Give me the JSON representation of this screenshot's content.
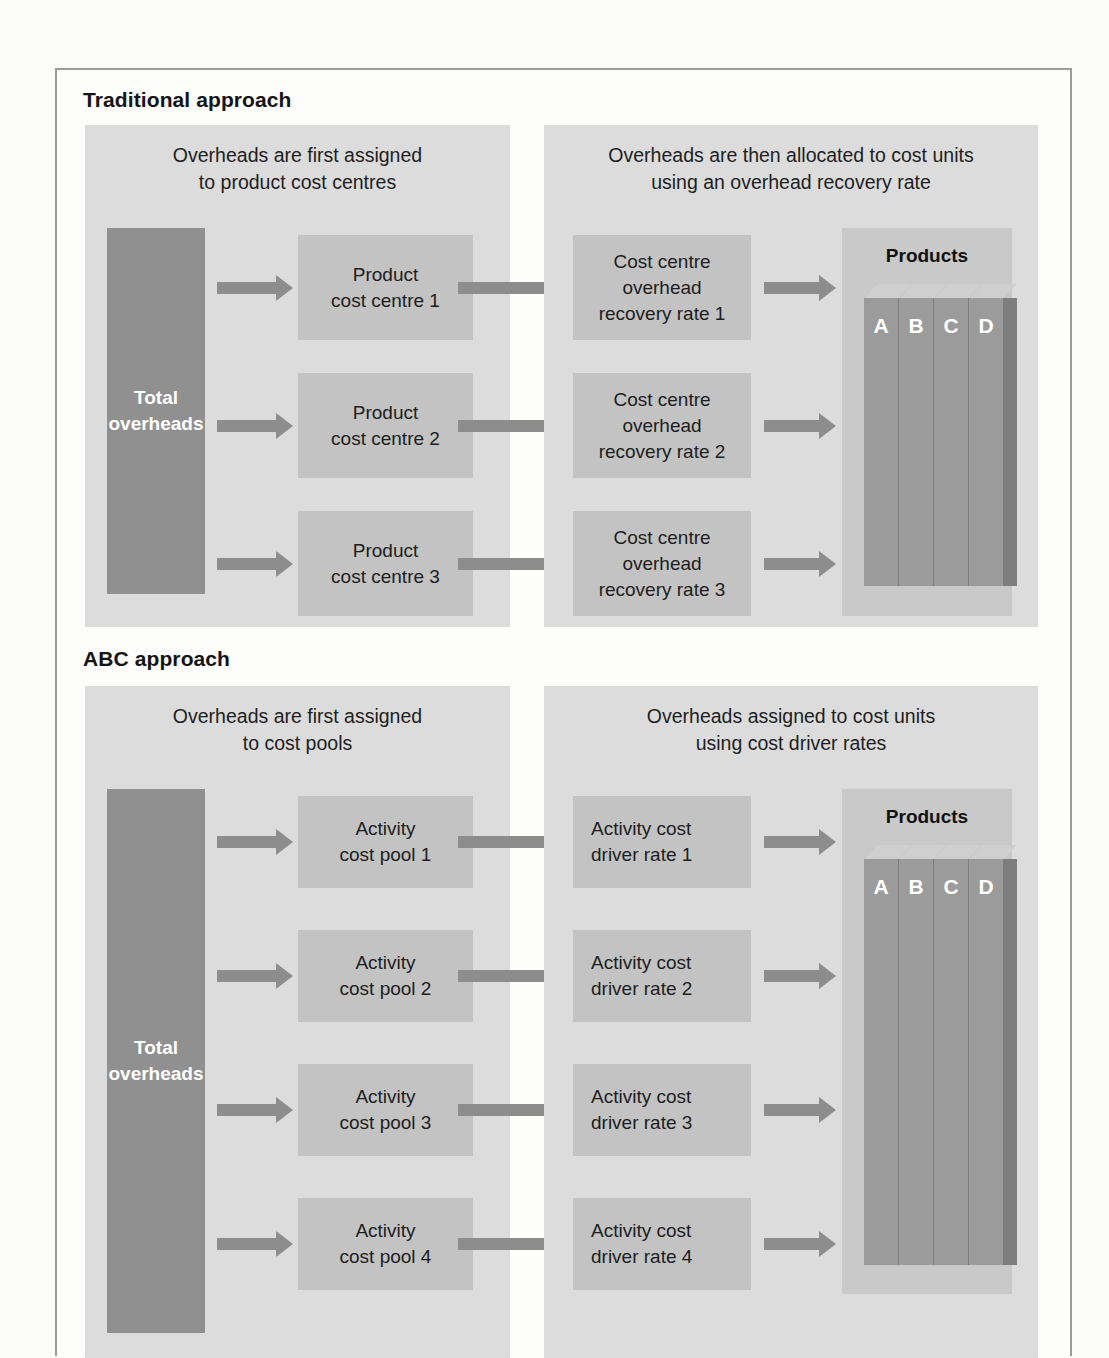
{
  "figure": {
    "sections": [
      {
        "id": "traditional",
        "title": "Traditional approach",
        "left_panel": {
          "caption_line1": "Overheads are first assigned",
          "caption_line2": "to product cost centres",
          "source_box": "Total overheads",
          "boxes": [
            "Product\ncost centre 1",
            "Product\ncost centre 2",
            "Product\ncost centre 3"
          ],
          "box_lines": [
            [
              "Product",
              "cost centre 1"
            ],
            [
              "Product",
              "cost centre 2"
            ],
            [
              "Product",
              "cost centre 3"
            ]
          ]
        },
        "right_panel": {
          "caption_line1": "Overheads are then allocated to cost units",
          "caption_line2": "using an overhead recovery rate",
          "box_lines": [
            [
              "Cost centre",
              "overhead",
              "recovery rate 1"
            ],
            [
              "Cost centre",
              "overhead",
              "recovery rate 2"
            ],
            [
              "Cost centre",
              "overhead",
              "recovery rate 3"
            ]
          ],
          "products": {
            "title": "Products",
            "labels": [
              "A",
              "B",
              "C",
              "D"
            ]
          }
        }
      },
      {
        "id": "abc",
        "title": "ABC approach",
        "left_panel": {
          "caption_line1": "Overheads are first assigned",
          "caption_line2": "to cost pools",
          "source_box": "Total overheads",
          "box_lines": [
            [
              "Activity",
              "cost pool 1"
            ],
            [
              "Activity",
              "cost pool 2"
            ],
            [
              "Activity",
              "cost pool 3"
            ],
            [
              "Activity",
              "cost pool 4"
            ]
          ]
        },
        "right_panel": {
          "caption_line1": "Overheads assigned to cost units",
          "caption_line2": "using cost driver rates",
          "box_lines": [
            [
              "Activity cost",
              "driver rate 1"
            ],
            [
              "Activity cost",
              "driver rate 2"
            ],
            [
              "Activity cost",
              "driver rate 3"
            ],
            [
              "Activity cost",
              "driver rate 4"
            ]
          ],
          "products": {
            "title": "Products",
            "labels": [
              "A",
              "B",
              "C",
              "D"
            ]
          }
        }
      }
    ],
    "colors": {
      "panel_bg": "#dcdcdc",
      "box_fill": "#c3c3c3",
      "box_shadow": "#9e9e9e",
      "total_fill": "#909090",
      "total_shadow": "#6f6f6f",
      "arrow": "#8d8d8d",
      "products_bg": "#c9c9c9",
      "bar_face": "#9b9b9b",
      "bar_top": "#cfcfcf",
      "bar_side": "#7e7e7e",
      "text": "#1d1d1d",
      "page_border": "#9b9b9b"
    }
  }
}
